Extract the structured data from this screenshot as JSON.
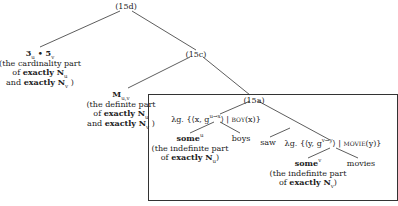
{
  "nodes": {
    "root": {
      "label": "(15d)"
    },
    "left_card": {
      "formula": "3",
      "formula_sub1": "u",
      "bullet": " • ",
      "formula2": "5",
      "formula_sub2": "v",
      "gloss1": "(the cardinality part",
      "gloss2_pre": "of ",
      "gloss2_bold": "exactly N",
      "gloss2_sub": "u",
      "gloss3_pre": "and ",
      "gloss3_bold": "exactly N",
      "gloss3_sub": "v",
      "gloss3_post": " )"
    },
    "c15c": {
      "label": "(15c)"
    },
    "definite": {
      "formula": "M",
      "formula_sub": "u,v",
      "gloss1": "(the definite part",
      "gloss2_pre": "of ",
      "gloss2_bold": "exactly N",
      "gloss2_sub": "u",
      "gloss3_pre": "and ",
      "gloss3_bold": "exactly N",
      "gloss3_sub": "v",
      "gloss3_post": " )"
    },
    "a15a": {
      "label": "(15a)"
    },
    "subj_np": {
      "pre": "λg. {⟨x, g",
      "sup": "u→x",
      "mid": "⟩ | ",
      "pred": "boy",
      "post": "(x)}"
    },
    "some_u": {
      "word": "some",
      "sup": "u",
      "gloss1": "(the indefinite part",
      "gloss2_pre": "of ",
      "gloss2_bold": "exactly N",
      "gloss2_sub": "u",
      "gloss2_post": ")"
    },
    "boys": {
      "word": "boys"
    },
    "saw": {
      "word": "saw"
    },
    "obj_np": {
      "pre": "λg. {⟨y, g",
      "sup": "v→y",
      "mid": "⟩ | ",
      "pred": "movie",
      "post": "(y)}"
    },
    "some_v": {
      "word": "some",
      "sup": "v",
      "gloss1": "(the indefinite part",
      "gloss2_pre": "of ",
      "gloss2_bold": "exactly N",
      "gloss2_sub": "v",
      "gloss2_post": ")"
    },
    "movies": {
      "word": "movies"
    }
  }
}
